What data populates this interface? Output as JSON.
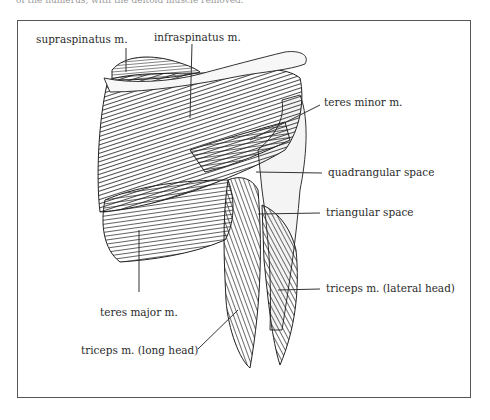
{
  "caption_fragment": "of the humerus, with the deltoid muscle removed.",
  "figure": {
    "labels": [
      {
        "id": "supraspinatus",
        "text": "supraspinatus m."
      },
      {
        "id": "infraspinatus",
        "text": "infraspinatus m."
      },
      {
        "id": "teres_minor",
        "text": "teres minor m."
      },
      {
        "id": "quadrangular_space",
        "text": "quadrangular space"
      },
      {
        "id": "triangular_space",
        "text": "triangular space"
      },
      {
        "id": "teres_major",
        "text": "teres major m."
      },
      {
        "id": "triceps_lateral",
        "text": "triceps m. (lateral head)"
      },
      {
        "id": "triceps_long",
        "text": "triceps m. (long head)"
      }
    ]
  },
  "colors": {
    "frame": "#555555",
    "ink": "#2a2a2a",
    "paper": "#ffffff"
  }
}
